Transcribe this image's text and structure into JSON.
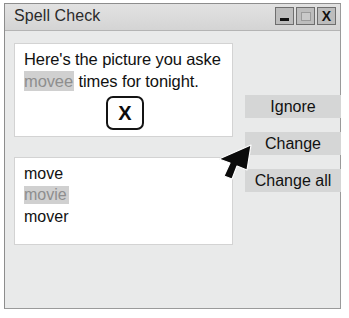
{
  "window": {
    "title": "Spell Check",
    "controls": [
      {
        "name": "minimize",
        "glyph": "minimize-icon"
      },
      {
        "name": "maximize",
        "glyph": "maximize-icon"
      },
      {
        "name": "close",
        "glyph": "close-icon",
        "label": "X"
      }
    ]
  },
  "document": {
    "line1": "Here's the picture you aske",
    "misspelled_word": "movee",
    "line2_rest": " times for tonight.",
    "inline_box_label": "X"
  },
  "suggestions": {
    "items": [
      {
        "label": "move",
        "selected": false
      },
      {
        "label": "movie",
        "selected": true
      },
      {
        "label": "mover",
        "selected": false
      }
    ]
  },
  "buttons": {
    "ignore": "Ignore",
    "change": "Change",
    "change_all": "Change all"
  },
  "cursor": {
    "icon": "mouse-pointer-icon",
    "points_at": "Change"
  },
  "colors": {
    "window_bg": "#e9eaea",
    "titlebar_bg": "#dcdcdc",
    "button_bg": "#d5d6d6",
    "highlight_bg": "#d0d0d0",
    "highlight_text": "#8e8e8e",
    "text": "#111111"
  }
}
